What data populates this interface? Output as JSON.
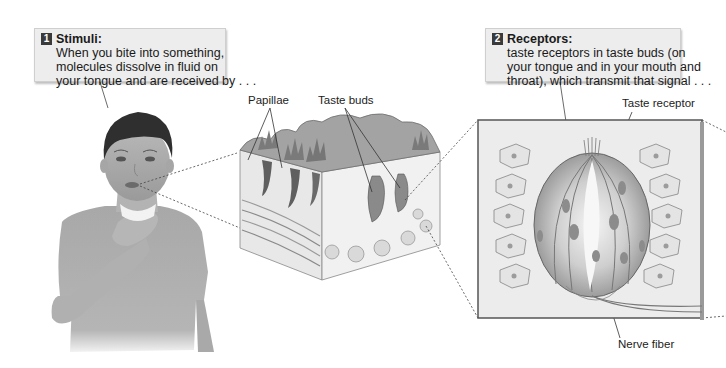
{
  "figure": {
    "callouts": [
      {
        "number": "1",
        "title": "Stimuli:",
        "lines": [
          "When you bite into something,",
          "molecules dissolve in fluid on",
          "your tongue and are received by . . ."
        ]
      },
      {
        "number": "2",
        "title": "Receptors:",
        "lines": [
          "taste receptors in taste buds (on",
          "your tongue and in your mouth and",
          "throat), which transmit that signal . . ."
        ]
      }
    ],
    "labels": {
      "papillae": "Papillae",
      "taste_buds": "Taste buds",
      "taste_receptor": "Taste receptor",
      "nerve_fiber": "Nerve fiber"
    },
    "panels": {
      "person": "boy-touching-throat",
      "tongue_block": "tongue-cross-section",
      "receptor_inset": "taste-bud-close-up"
    }
  }
}
